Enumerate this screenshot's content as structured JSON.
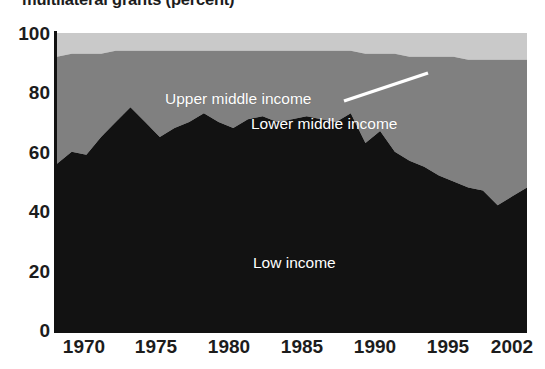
{
  "chart_data": {
    "type": "area",
    "stacked": true,
    "title": "multilateral grants (percent)",
    "xlabel": "",
    "ylabel": "",
    "xlim": [
      1970,
      2002
    ],
    "ylim": [
      0,
      100
    ],
    "grid": false,
    "legend_position": "inline-annotations",
    "x_ticks": [
      "1970",
      "1975",
      "1980",
      "1985",
      "1990",
      "1995",
      "2002"
    ],
    "x_tick_values": [
      1970,
      1975,
      1980,
      1985,
      1990,
      1995,
      2002
    ],
    "y_ticks": [
      "0",
      "20",
      "40",
      "60",
      "80",
      "100"
    ],
    "y_tick_values": [
      0,
      20,
      40,
      60,
      80,
      100
    ],
    "x": [
      1970,
      1971,
      1972,
      1973,
      1974,
      1975,
      1976,
      1977,
      1978,
      1979,
      1980,
      1981,
      1982,
      1983,
      1984,
      1985,
      1986,
      1987,
      1988,
      1989,
      1990,
      1991,
      1992,
      1993,
      1994,
      1995,
      1996,
      1997,
      1998,
      1999,
      2000,
      2001,
      2002
    ],
    "series": [
      {
        "name": "Low income",
        "color": "#121212",
        "values": [
          56,
          60,
          59,
          65,
          70,
          75,
          70,
          65,
          68,
          70,
          73,
          70,
          68,
          71,
          72,
          70,
          71,
          72,
          71,
          70,
          73,
          63,
          67,
          60,
          57,
          55,
          52,
          50,
          48,
          47,
          42,
          45,
          48
        ]
      },
      {
        "name": "Lower middle income",
        "color": "#808080",
        "values": [
          36,
          33,
          34,
          28,
          24,
          19,
          24,
          29,
          26,
          24,
          21,
          24,
          26,
          23,
          22,
          24,
          23,
          22,
          23,
          24,
          21,
          30,
          26,
          33,
          35,
          37,
          40,
          42,
          43,
          44,
          49,
          46,
          43
        ]
      },
      {
        "name": "Upper middle income",
        "color": "#c9c9c9",
        "values": [
          8,
          7,
          7,
          7,
          6,
          6,
          6,
          6,
          6,
          6,
          6,
          6,
          6,
          6,
          6,
          6,
          6,
          6,
          6,
          6,
          6,
          7,
          7,
          7,
          8,
          8,
          8,
          8,
          9,
          9,
          9,
          9,
          9
        ]
      }
    ],
    "cumulative_tops": {
      "low_income": [
        56,
        60,
        59,
        65,
        70,
        75,
        70,
        65,
        68,
        70,
        73,
        70,
        68,
        71,
        72,
        70,
        71,
        72,
        71,
        70,
        73,
        63,
        67,
        60,
        57,
        55,
        52,
        50,
        48,
        47,
        42,
        45,
        48
      ],
      "lower_middle_income": [
        92,
        93,
        93,
        93,
        94,
        94,
        94,
        94,
        94,
        94,
        94,
        94,
        94,
        94,
        94,
        94,
        94,
        94,
        94,
        94,
        94,
        93,
        93,
        93,
        92,
        92,
        92,
        92,
        91,
        91,
        91,
        91,
        91
      ]
    },
    "annotations": [
      {
        "name": "upper-middle-income",
        "text": "Upper middle income",
        "leader_line": true
      },
      {
        "name": "lower-middle-income",
        "text": "Lower middle income",
        "leader_line": false
      },
      {
        "name": "low-income",
        "text": "Low income",
        "leader_line": false
      }
    ]
  },
  "colors": {
    "low_income": "#121212",
    "lower_middle_income": "#808080",
    "upper_middle_income": "#c9c9c9",
    "axis": "#111111",
    "label_text": "#1c1c1c",
    "inline_label_text": "#ffffff",
    "background": "#ffffff"
  }
}
